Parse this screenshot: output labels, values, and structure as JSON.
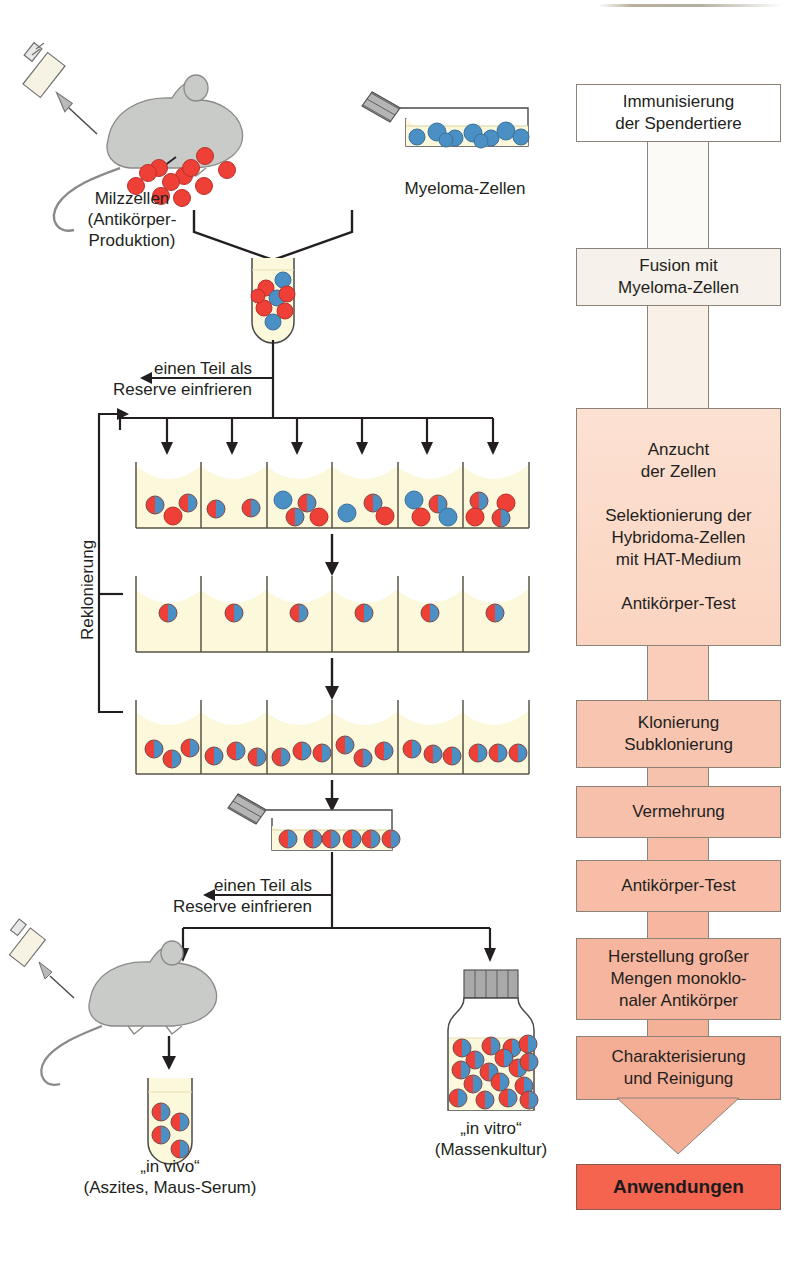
{
  "left_diagram": {
    "labels": {
      "spleen_cells": "Milzzellen\n(Antikörper-\nProduktion)",
      "myeloma_cells": "Myeloma-Zellen",
      "freeze_reserve_1": "einen Teil als\nReserve einfrieren",
      "freeze_reserve_2": "einen Teil als\nReserve einfrieren",
      "recloning": "Reklonierung",
      "in_vivo": "„in vivo“\n(Aszites, Maus-Serum)",
      "in_vitro": "„in vitro“\n(Massenkultur)"
    },
    "icons": {
      "syringe_top": "syringe-icon",
      "syringe_bottom": "syringe-icon",
      "mouse_top": "mouse-icon",
      "mouse_bottom": "mouse-icon",
      "flask_myeloma": "culture-flask-icon",
      "flask_clone": "culture-flask-icon",
      "tube_fusion": "test-tube-icon",
      "tube_ascites": "test-tube-icon",
      "bottle_mass_culture": "culture-bottle-icon"
    },
    "cell_counts": {
      "spleen_free_cells": 11,
      "myeloma_flask_cells": 9,
      "fusion_tube_cells": 8,
      "clone_flask_cells": 6,
      "ascites_tube_cells": 4,
      "mass_culture_cells": 17
    },
    "well_rows": [
      {
        "name": "selection-row",
        "wells": [
          [
            "hyb",
            "red",
            "hyb"
          ],
          [
            "hyb",
            "hyb"
          ],
          [
            "blue",
            "hyb",
            "hyb",
            "red"
          ],
          [
            "blue",
            "hyb",
            "red"
          ],
          [
            "blue",
            "hyb",
            "red",
            "blue"
          ],
          [
            "hyb",
            "red",
            "red",
            "hyb"
          ]
        ]
      },
      {
        "name": "cloning-row",
        "wells": [
          [
            "hyb"
          ],
          [
            "hyb"
          ],
          [
            "hyb"
          ],
          [
            "hyb"
          ],
          [
            "hyb"
          ],
          [
            "hyb"
          ]
        ]
      },
      {
        "name": "subcloning-row",
        "wells": [
          [
            "hyb",
            "hyb",
            "hyb"
          ],
          [
            "hyb",
            "hyb",
            "hyb"
          ],
          [
            "hyb",
            "hyb",
            "hyb"
          ],
          [
            "hyb",
            "hyb",
            "hyb"
          ],
          [
            "hyb",
            "hyb",
            "hyb"
          ],
          [
            "hyb",
            "hyb",
            "hyb"
          ]
        ]
      }
    ]
  },
  "flowchart": {
    "steps": [
      {
        "id": "immunisierung",
        "text": "Immunisierung\nder Spendertiere",
        "fill": "#ffffff"
      },
      {
        "id": "fusion",
        "text": "Fusion mit\nMyeloma-Zellen",
        "fill": "#f6f1ea"
      },
      {
        "id": "anzucht",
        "text": "Anzucht\nder Zellen\n\nSelektionierung der\nHybridoma-Zellen\nmit HAT-Medium\n\nAntikörper-Test",
        "fill": "#fbddcd"
      },
      {
        "id": "klonierung",
        "text": "Klonierung\nSubklonierung",
        "fill": "#f7c5b0"
      },
      {
        "id": "vermehrung",
        "text": "Vermehrung",
        "fill": "#f7c0ab"
      },
      {
        "id": "antikoerper-test",
        "text": "Antikörper-Test",
        "fill": "#f7bda6"
      },
      {
        "id": "herstellung",
        "text": "Herstellung großer\nMengen monoklo-\nnaler Antikörper",
        "fill": "#f6b59e"
      },
      {
        "id": "charakterisierung",
        "text": "Charakterisierung\nund Reinigung",
        "fill": "#f5ae96"
      }
    ],
    "final": {
      "id": "anwendungen",
      "text": "Anwendungen",
      "fill": "#f4644f"
    }
  },
  "colors": {
    "spleen_cell_red": "#ee4036",
    "myeloma_cell_blue": "#4a90c4",
    "medium_yellow": "#fbf8dc",
    "mouse_gray": "#c9cbc8",
    "cap_gray": "#a9a9a9",
    "flow_start": "#ffffff",
    "flow_end": "#f5ae96",
    "final_red": "#f4644f",
    "outline": "#231f20"
  }
}
